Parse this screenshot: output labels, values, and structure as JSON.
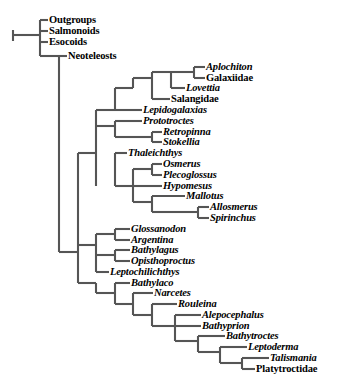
{
  "figure": {
    "type": "cladogram",
    "background_color": "#ffffff",
    "line_color": "#555555",
    "text_color": "#000000",
    "width": 350,
    "height": 384,
    "root_scale_tick": true
  },
  "taxa": [
    {
      "id": "outgroups",
      "label": "Outgroups",
      "style": "roman",
      "x": 49,
      "y": 20
    },
    {
      "id": "salmonoids",
      "label": "Salmonoids",
      "style": "roman",
      "x": 49,
      "y": 31
    },
    {
      "id": "esocoids",
      "label": "Esocoids",
      "style": "roman",
      "x": 49,
      "y": 42
    },
    {
      "id": "neoteleosts",
      "label": "Neoteleosts",
      "style": "roman",
      "x": 68,
      "y": 56
    },
    {
      "id": "aplochiton",
      "label": "Aplochiton",
      "style": "italic",
      "x": 206,
      "y": 67
    },
    {
      "id": "galaxiidae",
      "label": "Galaxiidae",
      "style": "roman",
      "x": 206,
      "y": 78
    },
    {
      "id": "lovettia",
      "label": "Lovettia",
      "style": "italic",
      "x": 186,
      "y": 88
    },
    {
      "id": "salangidae",
      "label": "Salangidae",
      "style": "roman",
      "x": 171,
      "y": 99
    },
    {
      "id": "lepidogalaxias",
      "label": "Lepidogalaxias",
      "style": "italic",
      "x": 143,
      "y": 110
    },
    {
      "id": "prototroctes",
      "label": "Prototroctes",
      "style": "italic",
      "x": 143,
      "y": 121
    },
    {
      "id": "retropinna",
      "label": "Retropinna",
      "style": "italic",
      "x": 163,
      "y": 132
    },
    {
      "id": "stokellia",
      "label": "Stokellia",
      "style": "italic",
      "x": 163,
      "y": 142
    },
    {
      "id": "thaleichthys",
      "label": "Thaleichthys",
      "style": "italic",
      "x": 128,
      "y": 153
    },
    {
      "id": "osmerus",
      "label": "Osmerus",
      "style": "italic",
      "x": 163,
      "y": 164
    },
    {
      "id": "plecoglossus",
      "label": "Plecoglossus",
      "style": "italic",
      "x": 163,
      "y": 175
    },
    {
      "id": "hypomesus",
      "label": "Hypomesus",
      "style": "italic",
      "x": 163,
      "y": 186
    },
    {
      "id": "mallotus",
      "label": "Mallotus",
      "style": "italic",
      "x": 186,
      "y": 196
    },
    {
      "id": "allosmerus",
      "label": "Allosmerus",
      "style": "italic",
      "x": 210,
      "y": 207
    },
    {
      "id": "spirinchus",
      "label": "Spirinchus",
      "style": "italic",
      "x": 210,
      "y": 218
    },
    {
      "id": "glossanodon",
      "label": "Glossanodon",
      "style": "italic",
      "x": 131,
      "y": 229
    },
    {
      "id": "argentina",
      "label": "Argentina",
      "style": "italic",
      "x": 131,
      "y": 240
    },
    {
      "id": "bathylagus",
      "label": "Bathylagus",
      "style": "italic",
      "x": 131,
      "y": 250
    },
    {
      "id": "opisthoproctus",
      "label": "Opisthoproctus",
      "style": "italic",
      "x": 131,
      "y": 261
    },
    {
      "id": "leptochilichthys",
      "label": "Leptochilichthys",
      "style": "italic",
      "x": 110,
      "y": 272
    },
    {
      "id": "bathylaco",
      "label": "Bathylaco",
      "style": "italic",
      "x": 131,
      "y": 283
    },
    {
      "id": "narcetes",
      "label": "Narcetes",
      "style": "italic",
      "x": 154,
      "y": 293
    },
    {
      "id": "rouleina",
      "label": "Rouleina",
      "style": "italic",
      "x": 178,
      "y": 304
    },
    {
      "id": "alepocephalus",
      "label": "Alepocephalus",
      "style": "italic",
      "x": 202,
      "y": 315
    },
    {
      "id": "bathyprion",
      "label": "Bathyprion",
      "style": "italic",
      "x": 202,
      "y": 326
    },
    {
      "id": "bathytroctes",
      "label": "Bathytroctes",
      "style": "italic",
      "x": 226,
      "y": 336
    },
    {
      "id": "leptoderma",
      "label": "Leptoderma",
      "style": "italic",
      "x": 248,
      "y": 347
    },
    {
      "id": "talismania",
      "label": "Talismania",
      "style": "italic",
      "x": 270,
      "y": 358
    },
    {
      "id": "platytroctidae",
      "label": "Platytroctidae",
      "style": "roman",
      "x": 256,
      "y": 369
    }
  ],
  "branches": {
    "horizontal": [
      {
        "id": "root-stub",
        "x1": 13,
        "x2": 40,
        "y": 35
      },
      {
        "id": "h-outgroups",
        "x1": 40,
        "x2": 48,
        "y": 20
      },
      {
        "id": "h-salmonoids",
        "x1": 40,
        "x2": 48,
        "y": 31
      },
      {
        "id": "h-esocoids",
        "x1": 40,
        "x2": 48,
        "y": 42
      },
      {
        "id": "h-node-A",
        "x1": 40,
        "x2": 59,
        "y": 56
      },
      {
        "id": "h-neoteleosts",
        "x1": 59,
        "x2": 67,
        "y": 56
      },
      {
        "id": "h-node-B",
        "x1": 59,
        "x2": 78,
        "y": 252
      },
      {
        "id": "h-node-C",
        "x1": 78,
        "x2": 96,
        "y": 153
      },
      {
        "id": "h-node-D",
        "x1": 96,
        "x2": 115,
        "y": 110
      },
      {
        "id": "h-node-E",
        "x1": 115,
        "x2": 133,
        "y": 88
      },
      {
        "id": "h-node-F",
        "x1": 133,
        "x2": 152,
        "y": 78
      },
      {
        "id": "h-node-G",
        "x1": 152,
        "x2": 171,
        "y": 72
      },
      {
        "id": "h-aplochiton",
        "x1": 194,
        "x2": 205,
        "y": 67
      },
      {
        "id": "h-galaxiidae",
        "x1": 194,
        "x2": 205,
        "y": 78
      },
      {
        "id": "h-node-G-right",
        "x1": 171,
        "x2": 194,
        "y": 72
      },
      {
        "id": "h-lovettia",
        "x1": 171,
        "x2": 185,
        "y": 88
      },
      {
        "id": "h-salangidae",
        "x1": 152,
        "x2": 170,
        "y": 99
      },
      {
        "id": "h-lepidogalaxias",
        "x1": 115,
        "x2": 142,
        "y": 110
      },
      {
        "id": "h-node-H",
        "x1": 96,
        "x2": 115,
        "y": 126
      },
      {
        "id": "h-prototroctes",
        "x1": 115,
        "x2": 142,
        "y": 121
      },
      {
        "id": "h-node-I",
        "x1": 133,
        "x2": 152,
        "y": 137
      },
      {
        "id": "h-node-I-left",
        "x1": 115,
        "x2": 133,
        "y": 137
      },
      {
        "id": "h-retropinna",
        "x1": 152,
        "x2": 162,
        "y": 132
      },
      {
        "id": "h-stokellia",
        "x1": 152,
        "x2": 162,
        "y": 142
      },
      {
        "id": "h-thaleichthys",
        "x1": 115,
        "x2": 127,
        "y": 153
      },
      {
        "id": "h-node-J",
        "x1": 115,
        "x2": 133,
        "y": 186
      },
      {
        "id": "h-node-K",
        "x1": 133,
        "x2": 152,
        "y": 169
      },
      {
        "id": "h-osmerus",
        "x1": 152,
        "x2": 162,
        "y": 164
      },
      {
        "id": "h-plecoglossus",
        "x1": 152,
        "x2": 162,
        "y": 175
      },
      {
        "id": "h-hypomesus",
        "x1": 133,
        "x2": 162,
        "y": 186
      },
      {
        "id": "h-node-L",
        "x1": 133,
        "x2": 152,
        "y": 202
      },
      {
        "id": "h-mallotus",
        "x1": 152,
        "x2": 185,
        "y": 196
      },
      {
        "id": "h-node-M",
        "x1": 152,
        "x2": 175,
        "y": 212
      },
      {
        "id": "h-node-N",
        "x1": 175,
        "x2": 198,
        "y": 212
      },
      {
        "id": "h-allosmerus",
        "x1": 198,
        "x2": 209,
        "y": 207
      },
      {
        "id": "h-spirinchus",
        "x1": 198,
        "x2": 209,
        "y": 218
      },
      {
        "id": "h-node-O",
        "x1": 78,
        "x2": 96,
        "y": 245
      },
      {
        "id": "h-node-P",
        "x1": 96,
        "x2": 115,
        "y": 234
      },
      {
        "id": "h-glossanodon",
        "x1": 115,
        "x2": 130,
        "y": 229
      },
      {
        "id": "h-argentina",
        "x1": 115,
        "x2": 130,
        "y": 240
      },
      {
        "id": "h-node-Q",
        "x1": 96,
        "x2": 115,
        "y": 255
      },
      {
        "id": "h-bathylagus",
        "x1": 115,
        "x2": 130,
        "y": 250
      },
      {
        "id": "h-opisthoproctus",
        "x1": 115,
        "x2": 130,
        "y": 261
      },
      {
        "id": "h-node-R",
        "x1": 78,
        "x2": 96,
        "y": 283
      },
      {
        "id": "h-leptochilichthys",
        "x1": 96,
        "x2": 109,
        "y": 272
      },
      {
        "id": "h-node-S",
        "x1": 96,
        "x2": 115,
        "y": 293
      },
      {
        "id": "h-bathylaco",
        "x1": 115,
        "x2": 130,
        "y": 283
      },
      {
        "id": "h-node-T",
        "x1": 115,
        "x2": 133,
        "y": 304
      },
      {
        "id": "h-narcetes",
        "x1": 133,
        "x2": 153,
        "y": 293
      },
      {
        "id": "h-node-U",
        "x1": 133,
        "x2": 152,
        "y": 315
      },
      {
        "id": "h-rouleina",
        "x1": 152,
        "x2": 177,
        "y": 304
      },
      {
        "id": "h-node-V",
        "x1": 152,
        "x2": 175,
        "y": 326
      },
      {
        "id": "h-alepocephalus",
        "x1": 175,
        "x2": 201,
        "y": 315
      },
      {
        "id": "h-bathyprion",
        "x1": 175,
        "x2": 201,
        "y": 326
      },
      {
        "id": "h-node-W",
        "x1": 175,
        "x2": 198,
        "y": 341
      },
      {
        "id": "h-bathytroctes",
        "x1": 198,
        "x2": 225,
        "y": 336
      },
      {
        "id": "h-node-X",
        "x1": 198,
        "x2": 220,
        "y": 352
      },
      {
        "id": "h-leptoderma",
        "x1": 220,
        "x2": 247,
        "y": 347
      },
      {
        "id": "h-node-Y",
        "x1": 220,
        "x2": 242,
        "y": 363
      },
      {
        "id": "h-talismania",
        "x1": 242,
        "x2": 269,
        "y": 358
      },
      {
        "id": "h-platytroctidae",
        "x1": 242,
        "x2": 255,
        "y": 369
      }
    ],
    "vertical": [
      {
        "id": "v-root-tick",
        "x": 13,
        "y1": 30,
        "y2": 41
      },
      {
        "id": "v-node-root",
        "x": 40,
        "y1": 20,
        "y2": 56
      },
      {
        "id": "v-node-A",
        "x": 59,
        "y1": 56,
        "y2": 252
      },
      {
        "id": "v-node-B",
        "x": 78,
        "y1": 153,
        "y2": 283
      },
      {
        "id": "v-node-C",
        "x": 96,
        "y1": 110,
        "y2": 186
      },
      {
        "id": "v-node-D",
        "x": 115,
        "y1": 88,
        "y2": 110
      },
      {
        "id": "v-node-E",
        "x": 133,
        "y1": 78,
        "y2": 88
      },
      {
        "id": "v-node-F",
        "x": 152,
        "y1": 72,
        "y2": 99
      },
      {
        "id": "v-node-G",
        "x": 171,
        "y1": 72,
        "y2": 88
      },
      {
        "id": "v-node-Gr",
        "x": 194,
        "y1": 67,
        "y2": 78
      },
      {
        "id": "v-node-H",
        "x": 115,
        "y1": 121,
        "y2": 137
      },
      {
        "id": "v-node-I",
        "x": 152,
        "y1": 132,
        "y2": 142
      },
      {
        "id": "v-node-J",
        "x": 115,
        "y1": 153,
        "y2": 186
      },
      {
        "id": "v-node-K",
        "x": 133,
        "y1": 169,
        "y2": 202
      },
      {
        "id": "v-node-Kb",
        "x": 152,
        "y1": 164,
        "y2": 175
      },
      {
        "id": "v-node-L",
        "x": 152,
        "y1": 196,
        "y2": 212
      },
      {
        "id": "v-node-N",
        "x": 198,
        "y1": 207,
        "y2": 218
      },
      {
        "id": "v-node-O",
        "x": 96,
        "y1": 234,
        "y2": 272
      },
      {
        "id": "v-node-P",
        "x": 115,
        "y1": 229,
        "y2": 240
      },
      {
        "id": "v-node-Q",
        "x": 115,
        "y1": 250,
        "y2": 261
      },
      {
        "id": "v-node-R",
        "x": 96,
        "y1": 283,
        "y2": 293
      },
      {
        "id": "v-node-S",
        "x": 115,
        "y1": 283,
        "y2": 304
      },
      {
        "id": "v-node-T",
        "x": 133,
        "y1": 293,
        "y2": 315
      },
      {
        "id": "v-node-U",
        "x": 152,
        "y1": 304,
        "y2": 326
      },
      {
        "id": "v-node-V",
        "x": 175,
        "y1": 315,
        "y2": 341
      },
      {
        "id": "v-node-W",
        "x": 198,
        "y1": 336,
        "y2": 352
      },
      {
        "id": "v-node-X",
        "x": 220,
        "y1": 347,
        "y2": 363
      },
      {
        "id": "v-node-Y",
        "x": 242,
        "y1": 358,
        "y2": 369
      }
    ]
  }
}
